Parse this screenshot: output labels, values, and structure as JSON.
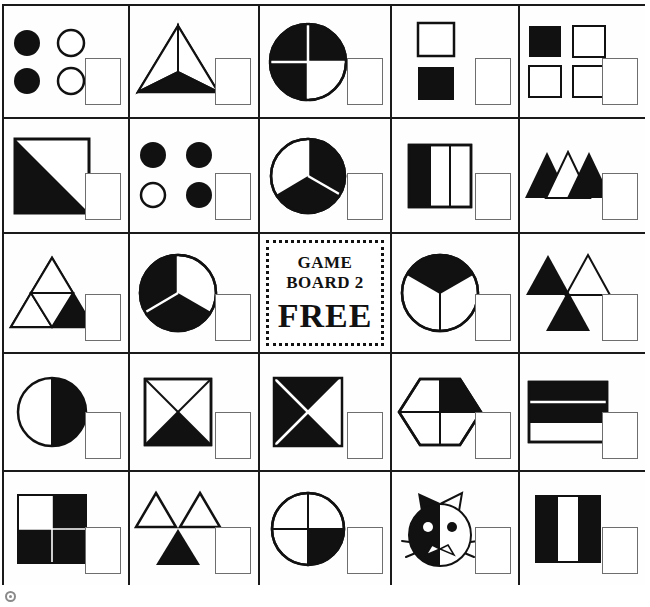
{
  "board": {
    "title": "GAME BOARD 2",
    "free_label": "FREE",
    "rows": 5,
    "columns": 5,
    "colors": {
      "ink": "#111111",
      "grid": "#1a1a1a",
      "answer_box_border": "#6e6e6e",
      "paper": "#ffffff"
    },
    "cells": [
      {
        "id": "r1c1",
        "name": "four-circles-two-shaded",
        "shape": "circles",
        "total_parts": 4,
        "shaded_parts": 2,
        "fraction": "2/4"
      },
      {
        "id": "r1c2",
        "name": "triangle-thirds-one-shaded",
        "shape": "triangle",
        "total_parts": 3,
        "shaded_parts": 1,
        "fraction": "1/3"
      },
      {
        "id": "r1c3",
        "name": "circle-quarters-three-shaded",
        "shape": "circle",
        "total_parts": 4,
        "shaded_parts": 3,
        "fraction": "3/4"
      },
      {
        "id": "r1c4",
        "name": "two-squares-one-shaded",
        "shape": "squares",
        "total_parts": 2,
        "shaded_parts": 1,
        "fraction": "1/2"
      },
      {
        "id": "r1c5",
        "name": "four-squares-one-shaded",
        "shape": "squares",
        "total_parts": 4,
        "shaded_parts": 1,
        "fraction": "1/4"
      },
      {
        "id": "r2c1",
        "name": "square-halved-diagonal-one-shaded",
        "shape": "square",
        "total_parts": 2,
        "shaded_parts": 1,
        "fraction": "1/2"
      },
      {
        "id": "r2c2",
        "name": "four-circles-three-shaded",
        "shape": "circles",
        "total_parts": 4,
        "shaded_parts": 3,
        "fraction": "3/4"
      },
      {
        "id": "r2c3",
        "name": "circle-thirds-two-shaded",
        "shape": "circle",
        "total_parts": 3,
        "shaded_parts": 2,
        "fraction": "2/3"
      },
      {
        "id": "r2c4",
        "name": "rectangle-vertical-thirds-one-shaded",
        "shape": "rectangle",
        "total_parts": 3,
        "shaded_parts": 1,
        "fraction": "1/3"
      },
      {
        "id": "r2c5",
        "name": "three-triangles-two-shaded",
        "shape": "triangles",
        "total_parts": 3,
        "shaded_parts": 2,
        "fraction": "2/3"
      },
      {
        "id": "r3c1",
        "name": "triangle-quarters-one-shaded",
        "shape": "triangle",
        "total_parts": 4,
        "shaded_parts": 1,
        "fraction": "1/4"
      },
      {
        "id": "r3c2",
        "name": "circle-thirds-two-shaded",
        "shape": "circle",
        "total_parts": 3,
        "shaded_parts": 2,
        "fraction": "2/3"
      },
      {
        "id": "r3c3",
        "name": "free-space",
        "shape": "free",
        "total_parts": 0,
        "shaded_parts": 0,
        "fraction": ""
      },
      {
        "id": "r3c4",
        "name": "circle-thirds-one-shaded",
        "shape": "circle",
        "total_parts": 3,
        "shaded_parts": 1,
        "fraction": "1/3"
      },
      {
        "id": "r3c5",
        "name": "three-triangles-two-shaded",
        "shape": "triangles",
        "total_parts": 3,
        "shaded_parts": 2,
        "fraction": "2/3"
      },
      {
        "id": "r4c1",
        "name": "circle-halved-one-shaded",
        "shape": "circle",
        "total_parts": 2,
        "shaded_parts": 1,
        "fraction": "1/2"
      },
      {
        "id": "r4c2",
        "name": "square-quarters-one-shaded",
        "shape": "square",
        "total_parts": 4,
        "shaded_parts": 1,
        "fraction": "1/4"
      },
      {
        "id": "r4c3",
        "name": "square-quarters-three-shaded",
        "shape": "square",
        "total_parts": 4,
        "shaded_parts": 3,
        "fraction": "3/4"
      },
      {
        "id": "r4c4",
        "name": "hexagon-quarters-one-shaded",
        "shape": "hexagon",
        "total_parts": 4,
        "shaded_parts": 1,
        "fraction": "1/4"
      },
      {
        "id": "r4c5",
        "name": "rectangle-horizontal-thirds-two-shaded",
        "shape": "rectangle",
        "total_parts": 3,
        "shaded_parts": 2,
        "fraction": "2/3"
      },
      {
        "id": "r5c1",
        "name": "square-quarters-three-shaded",
        "shape": "square",
        "total_parts": 4,
        "shaded_parts": 3,
        "fraction": "3/4"
      },
      {
        "id": "r5c2",
        "name": "three-triangles-one-shaded",
        "shape": "triangles",
        "total_parts": 3,
        "shaded_parts": 1,
        "fraction": "1/3"
      },
      {
        "id": "r5c3",
        "name": "circle-quarters-one-shaded",
        "shape": "circle",
        "total_parts": 4,
        "shaded_parts": 1,
        "fraction": "1/4"
      },
      {
        "id": "r5c4",
        "name": "cat-face-halved-one-shaded",
        "shape": "cat",
        "total_parts": 2,
        "shaded_parts": 1,
        "fraction": "1/2"
      },
      {
        "id": "r5c5",
        "name": "square-vertical-thirds-two-shaded",
        "shape": "square",
        "total_parts": 3,
        "shaded_parts": 2,
        "fraction": "2/3"
      }
    ]
  },
  "footer": {
    "mark": "copyright-mark"
  }
}
